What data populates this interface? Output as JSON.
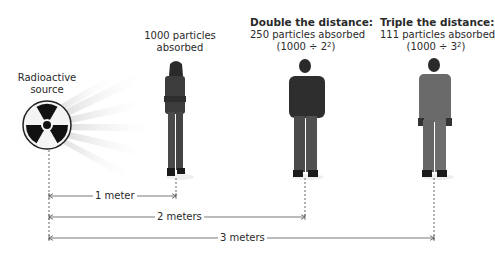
{
  "source": {
    "label_line1": "Radioactive",
    "label_line2": "source"
  },
  "people": [
    {
      "title": "",
      "line1": "1000 particles",
      "line2": "absorbed",
      "formula": ""
    },
    {
      "title": "Double the distance:",
      "line1": "250 particles absorbed",
      "formula_base": "(1000 ÷ 2",
      "formula_exp": "2",
      "formula_close": ")"
    },
    {
      "title": "Triple the distance:",
      "line1": "111 particles absorbed",
      "formula_base": "(1000 ÷ 3",
      "formula_exp": "2",
      "formula_close": ")"
    }
  ],
  "distances": [
    {
      "label": "1 meter"
    },
    {
      "label": "2 meters"
    },
    {
      "label": "3 meters"
    }
  ],
  "colors": {
    "line": "#555555",
    "text": "#2a2a2a",
    "rays": "#e8e8e8"
  }
}
